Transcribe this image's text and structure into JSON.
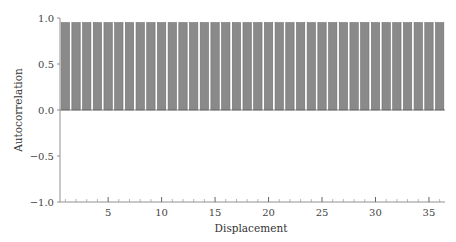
{
  "chart_data": {
    "type": "bar",
    "title": "",
    "xlabel": "Displacement",
    "ylabel": "Autocorrelation",
    "ylim": [
      -1.0,
      1.0
    ],
    "xlim": [
      0.5,
      36.5
    ],
    "yticks": [
      -1.0,
      -0.5,
      0.0,
      0.5,
      1.0
    ],
    "ytick_labels": [
      "−1.0",
      "−0.5",
      "0.0",
      "0.5",
      "1.0"
    ],
    "xticks_major": [
      5,
      10,
      15,
      20,
      25,
      30,
      35
    ],
    "xtick_labels": [
      "5",
      "10",
      "15",
      "20",
      "25",
      "30",
      "35"
    ],
    "xticks_minor_every": 1,
    "grid": false,
    "legend": null,
    "bar_color": "#8a8a8a",
    "bar_edge_color": "#6f6f6f",
    "categories": [
      1,
      2,
      3,
      4,
      5,
      6,
      7,
      8,
      9,
      10,
      11,
      12,
      13,
      14,
      15,
      16,
      17,
      18,
      19,
      20,
      21,
      22,
      23,
      24,
      25,
      26,
      27,
      28,
      29,
      30,
      31,
      32,
      33,
      34,
      35,
      36
    ],
    "values": [
      0.95,
      0.95,
      0.95,
      0.95,
      0.95,
      0.95,
      0.95,
      0.95,
      0.95,
      0.95,
      0.95,
      0.95,
      0.95,
      0.95,
      0.95,
      0.95,
      0.95,
      0.95,
      0.95,
      0.95,
      0.95,
      0.95,
      0.95,
      0.95,
      0.95,
      0.95,
      0.95,
      0.95,
      0.95,
      0.95,
      0.95,
      0.95,
      0.95,
      0.95,
      0.95,
      0.95
    ]
  }
}
